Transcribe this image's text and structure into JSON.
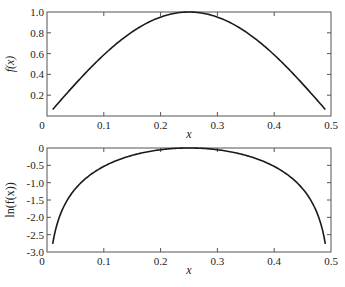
{
  "chart_data": [
    {
      "type": "line",
      "title": "",
      "xlabel": "x",
      "ylabel": "f(x)",
      "xlim": [
        0,
        0.5
      ],
      "ylim": [
        0,
        1.0
      ],
      "xticks": [
        "0",
        "0.1",
        "0.2",
        "0.3",
        "0.4",
        "0.5"
      ],
      "yticks": [
        "0",
        "0.2",
        "0.4",
        "0.6",
        "0.8",
        "1.0"
      ],
      "grid": false,
      "legend": null,
      "series": [
        {
          "name": "f(x)",
          "color": "#1a1a1a",
          "x": [
            0.01,
            0.03,
            0.05,
            0.07,
            0.09,
            0.11,
            0.13,
            0.15,
            0.17,
            0.19,
            0.21,
            0.23,
            0.25,
            0.27,
            0.29,
            0.31,
            0.33,
            0.35,
            0.37,
            0.39,
            0.41,
            0.43,
            0.45,
            0.47,
            0.49
          ],
          "y": [
            0.063,
            0.187,
            0.309,
            0.426,
            0.536,
            0.637,
            0.729,
            0.809,
            0.876,
            0.93,
            0.969,
            0.992,
            1.0,
            0.992,
            0.969,
            0.93,
            0.876,
            0.809,
            0.729,
            0.637,
            0.536,
            0.426,
            0.309,
            0.187,
            0.063
          ]
        }
      ]
    },
    {
      "type": "line",
      "title": "",
      "xlabel": "x",
      "ylabel": "ln(f(x))",
      "xlim": [
        0,
        0.5
      ],
      "ylim": [
        -3.0,
        0
      ],
      "xticks": [
        "0",
        "0.1",
        "0.2",
        "0.3",
        "0.4",
        "0.5"
      ],
      "yticks": [
        "0",
        "-0.5",
        "-1.0",
        "-1.5",
        "-2.0",
        "-2.5",
        "-3.0"
      ],
      "grid": false,
      "legend": null,
      "series": [
        {
          "name": "ln(f(x))",
          "color": "#1a1a1a",
          "x": [
            0.01,
            0.03,
            0.05,
            0.07,
            0.09,
            0.11,
            0.13,
            0.15,
            0.17,
            0.19,
            0.21,
            0.23,
            0.25,
            0.27,
            0.29,
            0.31,
            0.33,
            0.35,
            0.37,
            0.39,
            0.41,
            0.43,
            0.45,
            0.47,
            0.49
          ],
          "y": [
            -2.76,
            -1.67,
            -1.17,
            -0.85,
            -0.62,
            -0.45,
            -0.32,
            -0.21,
            -0.13,
            -0.07,
            -0.03,
            -0.01,
            0.0,
            -0.01,
            -0.03,
            -0.07,
            -0.13,
            -0.21,
            -0.32,
            -0.45,
            -0.62,
            -0.85,
            -1.17,
            -1.67,
            -2.76
          ]
        }
      ]
    }
  ],
  "plots": {
    "top": {
      "ylabel": "f(x)",
      "xlabel": "x",
      "xticks": [
        "0",
        "0.1",
        "0.2",
        "0.3",
        "0.4",
        "0.5"
      ],
      "yticks": [
        "0",
        "0.2",
        "0.4",
        "0.6",
        "0.8",
        "1.0"
      ]
    },
    "bottom": {
      "ylabel": "ln(f(x))",
      "xlabel": "x",
      "xticks": [
        "0",
        "0.1",
        "0.2",
        "0.3",
        "0.4",
        "0.5"
      ],
      "yticks": [
        "0",
        "-0.5",
        "-1.0",
        "-1.5",
        "-2.0",
        "-2.5",
        "-3.0"
      ]
    }
  }
}
